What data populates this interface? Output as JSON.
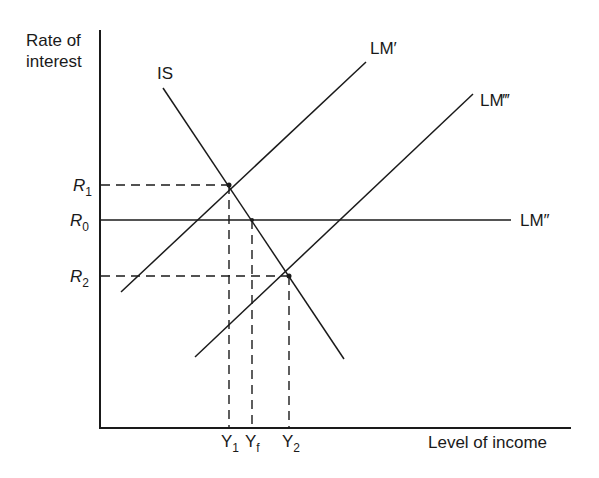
{
  "diagram": {
    "type": "IS-LM diagram",
    "y_axis_label_line1": "Rate of",
    "y_axis_label_line2": "interest",
    "x_axis_label": "Level of income",
    "curves": {
      "is": "IS",
      "lm_prime": "LM′",
      "lm_double_prime": "LM″",
      "lm_triple_prime": "LM‴"
    },
    "y_ticks": {
      "r1": {
        "base": "R",
        "sub": "1"
      },
      "r0": {
        "base": "R",
        "sub": "0"
      },
      "r2": {
        "base": "R",
        "sub": "2"
      }
    },
    "x_ticks": {
      "y1": {
        "base": "Y",
        "sub": "1"
      },
      "yf": {
        "base": "Y",
        "sub": "f"
      },
      "y2": {
        "base": "Y",
        "sub": "2"
      }
    },
    "line_color": "#1a1a1a"
  }
}
